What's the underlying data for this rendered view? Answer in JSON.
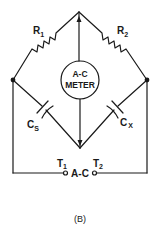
{
  "diagram": {
    "type": "ac-capacitance-bridge-circuit",
    "caption": "(B)",
    "components": {
      "r1": {
        "label": "R",
        "sub": "1",
        "type": "resistor"
      },
      "r2": {
        "label": "R",
        "sub": "2",
        "type": "resistor"
      },
      "cs": {
        "label": "C",
        "sub": "S",
        "type": "capacitor"
      },
      "cx": {
        "label": "C",
        "sub": "X",
        "type": "capacitor"
      },
      "meter": {
        "line1": "A-C",
        "line2": "METER",
        "type": "ac-meter"
      },
      "t1": {
        "label": "T",
        "sub": "1",
        "type": "terminal"
      },
      "t2": {
        "label": "T",
        "sub": "2",
        "type": "terminal"
      },
      "source": {
        "label": "A-C",
        "type": "ac-source-label"
      }
    },
    "colors": {
      "line": "#1a1a1a",
      "background": "#ffffff"
    }
  }
}
